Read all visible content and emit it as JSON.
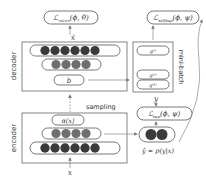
{
  "diagram": {
    "decoder": {
      "label": "decoder",
      "output_label": "x̂",
      "loss_label": "ℒ",
      "loss_sub": "recon",
      "loss_args": "(ϕ, θ)",
      "rows": [
        {
          "circles": 6,
          "color": "#3a3a3a"
        },
        {
          "circles": 4,
          "color": "#6e6e6e"
        }
      ],
      "bottleneck_label": "b"
    },
    "encoder": {
      "label": "encoder",
      "input_label": "x",
      "top_label": "α(x)",
      "rows": [
        {
          "circles": 4,
          "color": "#6e6e6e"
        },
        {
          "circles": 6,
          "color": "#3a3a3a"
        }
      ]
    },
    "sampling_label": "sampling",
    "minibatch": {
      "label": "mini-batch",
      "items": [
        "g⁽ⁱ⁾",
        "g⁽ʲ⁾",
        "g⁽ᵏ⁾"
      ]
    },
    "self_loss": {
      "symbol": "ℒ",
      "sub": "selfsup",
      "args": "(ϕ, ψ)"
    },
    "sup_loss": {
      "symbol": "ℒ",
      "sub": "sup",
      "args": "(ϕ, ψ)"
    },
    "target_label": "y",
    "prediction": {
      "circles": 2,
      "color": "#3a3a3a",
      "label": "ŷ ≈ p(y|x)"
    }
  }
}
